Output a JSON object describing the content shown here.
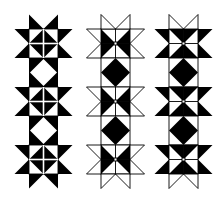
{
  "figure": {
    "colors": {
      "ink": "#000000",
      "paper": "#ffffff"
    },
    "columns": [
      {
        "name": "solid-stars",
        "x": 29,
        "points_style": "filled",
        "core_style": "center-diamond",
        "connector_style": "white-diamond"
      },
      {
        "name": "outline-stars",
        "x": 101,
        "points_style": "outline",
        "core_style": "outer-black",
        "connector_style": "black-diamond"
      },
      {
        "name": "hourglass-stars",
        "x": 169,
        "points_style": "sides-filled",
        "core_style": "hourglass",
        "connector_style": "black-diamond"
      }
    ],
    "grid": {
      "unit": 14.5,
      "top": 29,
      "stars_per_column": 3
    }
  }
}
